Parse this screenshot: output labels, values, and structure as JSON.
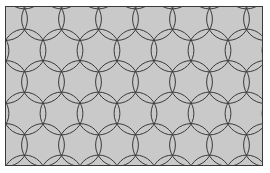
{
  "figure": {
    "caption": "",
    "type": "geometric-pattern"
  },
  "canvas": {
    "width": 270,
    "height": 173,
    "background_color": "#ffffff"
  },
  "frame": {
    "x": 5,
    "y": 6,
    "width": 258,
    "height": 160,
    "fill_color": "#c9c9c9",
    "border_color": "#3a3a3a",
    "border_width": 1
  },
  "pattern": {
    "name": "flower-of-life",
    "lattice": "triangular",
    "circle_radius": 21.4,
    "column_spacing": 37,
    "row_spacing": 37,
    "row_offset": 18.5,
    "line_color": "#3a3a3a",
    "line_width": 1,
    "origin_x": 5,
    "origin_y": 18,
    "columns": 8,
    "rows": 6
  },
  "chart_data": {
    "type": "scatter",
    "xlabel": "",
    "ylabel": "",
    "grid": false,
    "legend": "none",
    "xlim": [
      0,
      258
    ],
    "ylim": [
      0,
      160
    ],
    "series": [
      {
        "name": "circle-centers",
        "note": "Centers of all drawn circles, in frame-local pixel coords; each circle radius 21.4",
        "x": [
          0,
          37,
          74,
          111,
          148,
          185,
          222,
          259,
          18.5,
          55.5,
          92.5,
          129.5,
          166.5,
          203.5,
          240.5,
          277.5,
          0,
          37,
          74,
          111,
          148,
          185,
          222,
          259,
          18.5,
          55.5,
          92.5,
          129.5,
          166.5,
          203.5,
          240.5,
          277.5,
          0,
          37,
          74,
          111,
          148,
          185,
          222,
          259,
          18.5,
          55.5,
          92.5,
          129.5,
          166.5,
          203.5,
          240.5,
          277.5
        ],
        "y": [
          12,
          12,
          12,
          12,
          12,
          12,
          12,
          12,
          43.5,
          43.5,
          43.5,
          43.5,
          43.5,
          43.5,
          43.5,
          43.5,
          75,
          75,
          75,
          75,
          75,
          75,
          75,
          75,
          106.5,
          106.5,
          106.5,
          106.5,
          106.5,
          106.5,
          106.5,
          106.5,
          138,
          138,
          138,
          138,
          138,
          138,
          138,
          138,
          169.5,
          169.5,
          169.5,
          169.5,
          169.5,
          169.5,
          169.5,
          169.5
        ]
      }
    ]
  }
}
